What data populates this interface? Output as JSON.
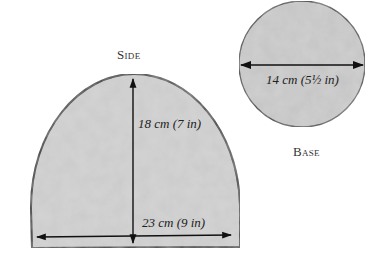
{
  "side": {
    "label": "Side",
    "height_dimension": "18 cm (7 in)",
    "width_dimension": "23 cm (9 in)"
  },
  "base": {
    "label": "Base",
    "diameter_dimension": "14 cm (5½ in)"
  },
  "colors": {
    "fill": "#c9c9c9",
    "outline": "#1a1a1a",
    "background": "#ffffff"
  }
}
